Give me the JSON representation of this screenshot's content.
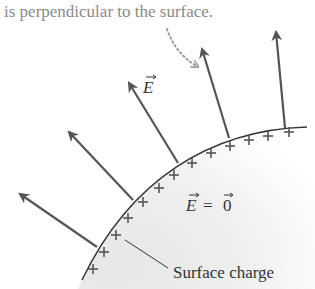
{
  "caption": {
    "text": "is perpendicular to the surface."
  },
  "labels": {
    "field_symbol": "E",
    "interior_lhs": "E",
    "interior_eq": "=",
    "interior_rhs": "0",
    "surface_charge": "Surface charge"
  },
  "colors": {
    "arrow": "#555555",
    "surface": "#333333",
    "interior_fill": "#ececec",
    "dotted_pointer": "#9a9a9a",
    "caption_text": "#8a8a8a",
    "plus_sign": "#555555"
  },
  "field_arrows": [
    {
      "id": "arrow-0",
      "base": [
        97,
        247
      ],
      "tip": [
        18,
        193
      ]
    },
    {
      "id": "arrow-1",
      "base": [
        133,
        200
      ],
      "tip": [
        67,
        130
      ]
    },
    {
      "id": "arrow-2",
      "base": [
        178,
        163
      ],
      "tip": [
        128,
        81
      ]
    },
    {
      "id": "arrow-3",
      "base": [
        229,
        138
      ],
      "tip": [
        201,
        47
      ]
    },
    {
      "id": "arrow-4",
      "base": [
        285,
        128
      ],
      "tip": [
        276,
        30
      ]
    }
  ],
  "plus_signs": [
    [
      93,
      269
    ],
    [
      104,
      252
    ],
    [
      116,
      235
    ],
    [
      128,
      218
    ],
    [
      143,
      202
    ],
    [
      159,
      188
    ],
    [
      174,
      175
    ],
    [
      192,
      163
    ],
    [
      211,
      153
    ],
    [
      230,
      146
    ],
    [
      249,
      140
    ],
    [
      268,
      136
    ],
    [
      289,
      132
    ]
  ]
}
